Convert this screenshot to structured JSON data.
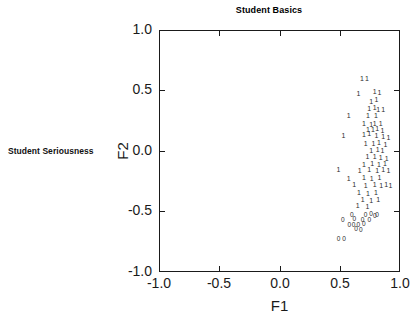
{
  "figure": {
    "title": "Student Basics",
    "side_label": "Student Seriousness",
    "background_color": "#ffffff",
    "axis_color": "#1a1a1a",
    "marker_color": "#2a2a2a"
  },
  "axes": {
    "xlabel": "F1",
    "ylabel": "F2",
    "xticks": [
      "-1.0",
      "-0.5",
      "0.0",
      "0.5",
      "1.0"
    ],
    "yticks": [
      "1.0",
      "0.5",
      "0.0",
      "-0.5",
      "-1.0"
    ]
  },
  "chart_data": {
    "type": "scatter",
    "title": "Student Basics",
    "xlabel": "F1",
    "ylabel": "F2",
    "xlim": [
      -1.0,
      1.0
    ],
    "ylim": [
      -1.0,
      1.0
    ],
    "xticks": [
      -1.0,
      -0.5,
      0.0,
      0.5,
      1.0
    ],
    "yticks": [
      -1.0,
      -0.5,
      0.0,
      0.5,
      1.0
    ],
    "grid": false,
    "legend": null,
    "legend_position": "none",
    "annotations": [
      "Student Seriousness"
    ],
    "marker_style": "text-glyph class labels",
    "series": [
      {
        "name": "1",
        "marker": "1",
        "points": [
          [
            0.685,
            0.605
          ],
          [
            0.725,
            0.605
          ],
          [
            0.655,
            0.48
          ],
          [
            0.79,
            0.495
          ],
          [
            0.83,
            0.49
          ],
          [
            0.76,
            0.415
          ],
          [
            0.805,
            0.43
          ],
          [
            0.745,
            0.355
          ],
          [
            0.79,
            0.36
          ],
          [
            0.82,
            0.345
          ],
          [
            0.86,
            0.35
          ],
          [
            0.575,
            0.3
          ],
          [
            0.735,
            0.3
          ],
          [
            0.8,
            0.295
          ],
          [
            0.7,
            0.23
          ],
          [
            0.76,
            0.225
          ],
          [
            0.79,
            0.23
          ],
          [
            0.84,
            0.235
          ],
          [
            0.735,
            0.185
          ],
          [
            0.775,
            0.18
          ],
          [
            0.81,
            0.19
          ],
          [
            0.855,
            0.175
          ],
          [
            0.53,
            0.135
          ],
          [
            0.7,
            0.14
          ],
          [
            0.745,
            0.145
          ],
          [
            0.805,
            0.13
          ],
          [
            0.86,
            0.12
          ],
          [
            0.905,
            0.115
          ],
          [
            0.715,
            0.07
          ],
          [
            0.78,
            0.065
          ],
          [
            0.825,
            0.075
          ],
          [
            0.88,
            0.06
          ],
          [
            0.76,
            0.01
          ],
          [
            0.815,
            0.015
          ],
          [
            0.855,
            0.005
          ],
          [
            0.73,
            -0.045
          ],
          [
            0.79,
            -0.04
          ],
          [
            0.84,
            -0.05
          ],
          [
            0.89,
            -0.055
          ],
          [
            0.7,
            -0.105
          ],
          [
            0.77,
            -0.1
          ],
          [
            0.825,
            -0.11
          ],
          [
            0.875,
            -0.095
          ],
          [
            0.49,
            -0.15
          ],
          [
            0.665,
            -0.155
          ],
          [
            0.745,
            -0.15
          ],
          [
            0.81,
            -0.16
          ],
          [
            0.86,
            -0.145
          ],
          [
            0.905,
            -0.155
          ],
          [
            0.575,
            -0.22
          ],
          [
            0.7,
            -0.215
          ],
          [
            0.765,
            -0.225
          ],
          [
            0.83,
            -0.215
          ],
          [
            0.62,
            -0.275
          ],
          [
            0.715,
            -0.28
          ],
          [
            0.79,
            -0.27
          ],
          [
            0.845,
            -0.285
          ],
          [
            0.885,
            -0.275
          ],
          [
            0.92,
            -0.28
          ],
          [
            0.66,
            -0.34
          ],
          [
            0.735,
            -0.345
          ],
          [
            0.8,
            -0.335
          ],
          [
            0.69,
            -0.4
          ],
          [
            0.76,
            -0.405
          ],
          [
            0.82,
            -0.395
          ],
          [
            0.65,
            -0.45
          ],
          [
            0.73,
            -0.455
          ]
        ]
      },
      {
        "name": "0",
        "marker": "0",
        "points": [
          [
            0.6,
            -0.52
          ],
          [
            0.715,
            -0.52
          ],
          [
            0.76,
            -0.515
          ],
          [
            0.79,
            -0.525
          ],
          [
            0.81,
            -0.52
          ],
          [
            0.525,
            -0.56
          ],
          [
            0.62,
            -0.555
          ],
          [
            0.69,
            -0.56
          ],
          [
            0.745,
            -0.565
          ],
          [
            0.58,
            -0.6
          ],
          [
            0.615,
            -0.605
          ],
          [
            0.655,
            -0.6
          ],
          [
            0.7,
            -0.595
          ],
          [
            0.635,
            -0.64
          ],
          [
            0.675,
            -0.645
          ],
          [
            0.49,
            -0.72
          ],
          [
            0.535,
            -0.72
          ]
        ]
      }
    ]
  }
}
